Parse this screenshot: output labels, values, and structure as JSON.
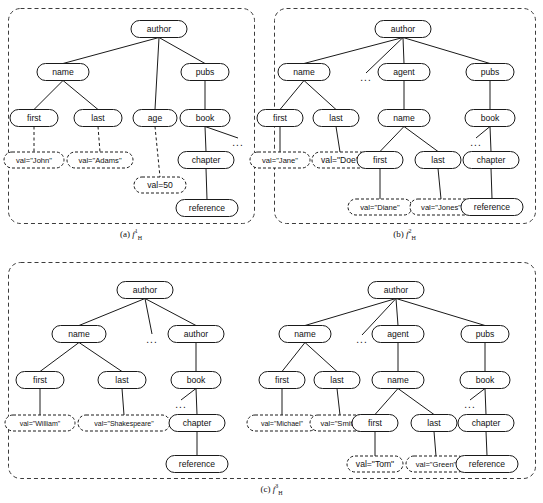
{
  "figure": {
    "panels": [
      {
        "id": "a",
        "caption_prefix": "(a)",
        "caption_symbol": "f",
        "caption_sup": "1",
        "caption_sub": "H",
        "box": {
          "x": 8,
          "y": 8,
          "w": 246,
          "h": 215
        },
        "nodes": [
          {
            "name": "author",
            "label": "author",
            "x": 159,
            "y": 29,
            "w": 56,
            "h": 17,
            "style": "solid"
          },
          {
            "name": "name",
            "label": "name",
            "x": 63,
            "y": 72,
            "w": 52,
            "h": 17,
            "style": "solid"
          },
          {
            "name": "pubs",
            "label": "pubs",
            "x": 205,
            "y": 72,
            "w": 48,
            "h": 17,
            "style": "solid"
          },
          {
            "name": "first",
            "label": "first",
            "x": 34,
            "y": 118,
            "w": 48,
            "h": 17,
            "style": "solid"
          },
          {
            "name": "last",
            "label": "last",
            "x": 98,
            "y": 118,
            "w": 48,
            "h": 17,
            "style": "solid"
          },
          {
            "name": "age",
            "label": "age",
            "x": 155,
            "y": 118,
            "w": 44,
            "h": 17,
            "style": "solid"
          },
          {
            "name": "book",
            "label": "book",
            "x": 205,
            "y": 118,
            "w": 50,
            "h": 17,
            "style": "solid"
          },
          {
            "name": "val-john",
            "label": "val=\"John\"",
            "x": 34,
            "y": 160,
            "w": 60,
            "h": 16,
            "style": "dashed"
          },
          {
            "name": "val-adams",
            "label": "val=\"Adams\"",
            "x": 100,
            "y": 160,
            "w": 66,
            "h": 16,
            "style": "dashed"
          },
          {
            "name": "val-50",
            "label": "val=50",
            "x": 160,
            "y": 185,
            "w": 52,
            "h": 16,
            "style": "dashed"
          },
          {
            "name": "chapter",
            "label": "chapter",
            "x": 206,
            "y": 160,
            "w": 56,
            "h": 17,
            "style": "solid"
          },
          {
            "name": "reference",
            "label": "reference",
            "x": 207,
            "y": 208,
            "w": 62,
            "h": 17,
            "style": "solid"
          }
        ],
        "edges": [
          {
            "from": "author",
            "to": "name",
            "style": "solid"
          },
          {
            "from": "author",
            "to": "age",
            "style": "solid"
          },
          {
            "from": "author",
            "to": "pubs",
            "style": "solid"
          },
          {
            "from": "name",
            "to": "first",
            "style": "solid"
          },
          {
            "from": "name",
            "to": "last",
            "style": "solid"
          },
          {
            "from": "pubs",
            "to": "book",
            "style": "solid"
          },
          {
            "from": "first",
            "to": "val-john",
            "style": "dashed"
          },
          {
            "from": "last",
            "to": "val-adams",
            "style": "dashed"
          },
          {
            "from": "age",
            "to": "val-50",
            "style": "dashed"
          },
          {
            "from": "book",
            "to": "chapter",
            "style": "solid"
          },
          {
            "from": "chapter",
            "to": "reference",
            "style": "solid"
          }
        ],
        "ellipses": [
          {
            "name": "book-ellipsis",
            "label": "...",
            "x": 232,
            "y": 143,
            "from": "book",
            "stub": true
          }
        ]
      },
      {
        "id": "b",
        "caption_prefix": "(b)",
        "caption_symbol": "f",
        "caption_sup": "2",
        "caption_sub": "H",
        "box": {
          "x": 274,
          "y": 8,
          "w": 261,
          "h": 215
        },
        "nodes": [
          {
            "name": "author",
            "label": "author",
            "x": 403,
            "y": 29,
            "w": 56,
            "h": 17,
            "style": "solid"
          },
          {
            "name": "name",
            "label": "name",
            "x": 304,
            "y": 72,
            "w": 52,
            "h": 17,
            "style": "solid"
          },
          {
            "name": "agent",
            "label": "agent",
            "x": 404,
            "y": 72,
            "w": 52,
            "h": 17,
            "style": "solid"
          },
          {
            "name": "pubs",
            "label": "pubs",
            "x": 490,
            "y": 72,
            "w": 48,
            "h": 17,
            "style": "solid"
          },
          {
            "name": "first",
            "label": "first",
            "x": 280,
            "y": 118,
            "w": 46,
            "h": 17,
            "style": "solid"
          },
          {
            "name": "last",
            "label": "last",
            "x": 336,
            "y": 118,
            "w": 46,
            "h": 17,
            "style": "solid"
          },
          {
            "name": "name2",
            "label": "name",
            "x": 404,
            "y": 118,
            "w": 52,
            "h": 17,
            "style": "solid"
          },
          {
            "name": "book",
            "label": "book",
            "x": 490,
            "y": 118,
            "w": 50,
            "h": 17,
            "style": "solid"
          },
          {
            "name": "val-jane",
            "label": "val=\"Jane\"",
            "x": 280,
            "y": 160,
            "w": 60,
            "h": 16,
            "style": "dashed"
          },
          {
            "name": "val-doe",
            "label": "val=\"Doe\"",
            "x": 340,
            "y": 160,
            "w": 56,
            "h": 16,
            "style": "dashed"
          },
          {
            "name": "first2",
            "label": "first",
            "x": 380,
            "y": 160,
            "w": 46,
            "h": 17,
            "style": "solid"
          },
          {
            "name": "last2",
            "label": "last",
            "x": 438,
            "y": 160,
            "w": 46,
            "h": 17,
            "style": "solid"
          },
          {
            "name": "chapter",
            "label": "chapter",
            "x": 491,
            "y": 160,
            "w": 56,
            "h": 17,
            "style": "solid"
          },
          {
            "name": "val-diane",
            "label": "val=\"Diane\"",
            "x": 380,
            "y": 207,
            "w": 64,
            "h": 16,
            "style": "dashed"
          },
          {
            "name": "val-jones",
            "label": "val=\"Jones\"",
            "x": 441,
            "y": 207,
            "w": 62,
            "h": 16,
            "style": "dashed"
          },
          {
            "name": "reference",
            "label": "reference",
            "x": 492,
            "y": 207,
            "w": 62,
            "h": 17,
            "style": "solid"
          }
        ],
        "edges": [
          {
            "from": "author",
            "to": "name",
            "style": "solid"
          },
          {
            "from": "author",
            "to": "agent",
            "style": "solid"
          },
          {
            "from": "author",
            "to": "pubs",
            "style": "solid"
          },
          {
            "from": "name",
            "to": "first",
            "style": "solid"
          },
          {
            "from": "name",
            "to": "last",
            "style": "solid"
          },
          {
            "from": "agent",
            "to": "name2",
            "style": "solid"
          },
          {
            "from": "pubs",
            "to": "book",
            "style": "solid"
          },
          {
            "from": "first",
            "to": "val-jane",
            "style": "solid"
          },
          {
            "from": "last",
            "to": "val-doe",
            "style": "solid"
          },
          {
            "from": "name2",
            "to": "first2",
            "style": "solid"
          },
          {
            "from": "name2",
            "to": "last2",
            "style": "solid"
          },
          {
            "from": "book",
            "to": "chapter",
            "style": "solid"
          },
          {
            "from": "first2",
            "to": "val-diane",
            "style": "solid"
          },
          {
            "from": "last2",
            "to": "val-jones",
            "style": "solid"
          },
          {
            "from": "chapter",
            "to": "reference",
            "style": "solid"
          }
        ],
        "ellipses": [
          {
            "name": "author-ellipsis",
            "label": "...",
            "x": 360,
            "y": 78,
            "from": "author",
            "stub": true
          },
          {
            "name": "book-ellipsis",
            "label": "...",
            "x": 470,
            "y": 143,
            "from": "book",
            "stub": true
          }
        ]
      },
      {
        "id": "c",
        "caption_prefix": "(c)",
        "caption_symbol": "f",
        "caption_sup": "3",
        "caption_sub": "H",
        "box": {
          "x": 8,
          "y": 262,
          "w": 527,
          "h": 216
        },
        "nodes": [
          {
            "name": "author-l",
            "label": "author",
            "x": 145,
            "y": 290,
            "w": 56,
            "h": 17,
            "style": "solid"
          },
          {
            "name": "name-l",
            "label": "name",
            "x": 79,
            "y": 334,
            "w": 54,
            "h": 17,
            "style": "solid"
          },
          {
            "name": "author-l2",
            "label": "author",
            "x": 196,
            "y": 334,
            "w": 56,
            "h": 17,
            "style": "solid"
          },
          {
            "name": "first-l",
            "label": "first",
            "x": 40,
            "y": 380,
            "w": 48,
            "h": 17,
            "style": "solid"
          },
          {
            "name": "last-l",
            "label": "last",
            "x": 122,
            "y": 380,
            "w": 48,
            "h": 17,
            "style": "solid"
          },
          {
            "name": "book-l",
            "label": "book",
            "x": 196,
            "y": 380,
            "w": 50,
            "h": 17,
            "style": "solid"
          },
          {
            "name": "val-william",
            "label": "val=\"William\"",
            "x": 40,
            "y": 423,
            "w": 70,
            "h": 16,
            "style": "dashed"
          },
          {
            "name": "val-shakespeare",
            "label": "val=\"Shakespeare\"",
            "x": 124,
            "y": 423,
            "w": 92,
            "h": 16,
            "style": "dashed"
          },
          {
            "name": "chapter-l",
            "label": "chapter",
            "x": 197,
            "y": 423,
            "w": 56,
            "h": 17,
            "style": "solid"
          },
          {
            "name": "reference-l",
            "label": "reference",
            "x": 197,
            "y": 464,
            "w": 62,
            "h": 17,
            "style": "solid"
          },
          {
            "name": "author-r",
            "label": "author",
            "x": 396,
            "y": 290,
            "w": 56,
            "h": 17,
            "style": "solid"
          },
          {
            "name": "name-r",
            "label": "name",
            "x": 305,
            "y": 334,
            "w": 52,
            "h": 17,
            "style": "solid"
          },
          {
            "name": "agent-r",
            "label": "agent",
            "x": 398,
            "y": 334,
            "w": 52,
            "h": 17,
            "style": "solid"
          },
          {
            "name": "pubs-r",
            "label": "pubs",
            "x": 485,
            "y": 334,
            "w": 48,
            "h": 17,
            "style": "solid"
          },
          {
            "name": "first-r",
            "label": "first",
            "x": 282,
            "y": 380,
            "w": 46,
            "h": 17,
            "style": "solid"
          },
          {
            "name": "last-r",
            "label": "last",
            "x": 337,
            "y": 380,
            "w": 46,
            "h": 17,
            "style": "solid"
          },
          {
            "name": "name-r2",
            "label": "name",
            "x": 398,
            "y": 380,
            "w": 52,
            "h": 17,
            "style": "solid"
          },
          {
            "name": "book-r",
            "label": "book",
            "x": 485,
            "y": 380,
            "w": 50,
            "h": 17,
            "style": "solid"
          },
          {
            "name": "val-michael",
            "label": "val=\"Michael\"",
            "x": 282,
            "y": 423,
            "w": 70,
            "h": 16,
            "style": "dashed"
          },
          {
            "name": "val-smith",
            "label": "val=\"Smith\"",
            "x": 340,
            "y": 423,
            "w": 60,
            "h": 16,
            "style": "dashed"
          },
          {
            "name": "first-r2",
            "label": "first",
            "x": 375,
            "y": 423,
            "w": 46,
            "h": 17,
            "style": "solid"
          },
          {
            "name": "last-r2",
            "label": "last",
            "x": 434,
            "y": 423,
            "w": 46,
            "h": 17,
            "style": "solid"
          },
          {
            "name": "chapter-r",
            "label": "chapter",
            "x": 486,
            "y": 423,
            "w": 56,
            "h": 17,
            "style": "solid"
          },
          {
            "name": "val-tom",
            "label": "val=\"Tom\"",
            "x": 375,
            "y": 464,
            "w": 56,
            "h": 16,
            "style": "dashed"
          },
          {
            "name": "val-green",
            "label": "val=\"Green\"",
            "x": 436,
            "y": 464,
            "w": 60,
            "h": 16,
            "style": "dashed"
          },
          {
            "name": "reference-r",
            "label": "reference",
            "x": 487,
            "y": 464,
            "w": 62,
            "h": 17,
            "style": "solid"
          }
        ],
        "edges": [
          {
            "from": "author-l",
            "to": "name-l",
            "style": "solid"
          },
          {
            "from": "author-l",
            "to": "author-l2",
            "style": "solid"
          },
          {
            "from": "name-l",
            "to": "first-l",
            "style": "solid"
          },
          {
            "from": "name-l",
            "to": "last-l",
            "style": "solid"
          },
          {
            "from": "author-l2",
            "to": "book-l",
            "style": "solid"
          },
          {
            "from": "first-l",
            "to": "val-william",
            "style": "solid"
          },
          {
            "from": "last-l",
            "to": "val-shakespeare",
            "style": "solid"
          },
          {
            "from": "book-l",
            "to": "chapter-l",
            "style": "solid"
          },
          {
            "from": "chapter-l",
            "to": "reference-l",
            "style": "solid"
          },
          {
            "from": "author-r",
            "to": "name-r",
            "style": "solid"
          },
          {
            "from": "author-r",
            "to": "agent-r",
            "style": "solid"
          },
          {
            "from": "author-r",
            "to": "pubs-r",
            "style": "solid"
          },
          {
            "from": "name-r",
            "to": "first-r",
            "style": "solid"
          },
          {
            "from": "name-r",
            "to": "last-r",
            "style": "solid"
          },
          {
            "from": "agent-r",
            "to": "name-r2",
            "style": "solid"
          },
          {
            "from": "pubs-r",
            "to": "book-r",
            "style": "solid"
          },
          {
            "from": "first-r",
            "to": "val-michael",
            "style": "solid"
          },
          {
            "from": "last-r",
            "to": "val-smith",
            "style": "solid"
          },
          {
            "from": "name-r2",
            "to": "first-r2",
            "style": "solid"
          },
          {
            "from": "name-r2",
            "to": "last-r2",
            "style": "solid"
          },
          {
            "from": "book-r",
            "to": "chapter-r",
            "style": "solid"
          },
          {
            "from": "first-r2",
            "to": "val-tom",
            "style": "solid"
          },
          {
            "from": "last-r2",
            "to": "val-green",
            "style": "solid"
          },
          {
            "from": "chapter-r",
            "to": "reference-r",
            "style": "solid"
          }
        ],
        "ellipses": [
          {
            "name": "author-l-ellipsis",
            "label": "...",
            "x": 146,
            "y": 340,
            "from": "author-l",
            "stub": false
          },
          {
            "name": "book-l-ellipsis",
            "label": "...",
            "x": 175,
            "y": 405,
            "from": "book-l",
            "stub": true
          },
          {
            "name": "author-r-ellipsis",
            "label": "...",
            "x": 356,
            "y": 340,
            "from": "author-r",
            "stub": true
          },
          {
            "name": "book-r-ellipsis",
            "label": "...",
            "x": 464,
            "y": 405,
            "from": "book-r",
            "stub": true
          }
        ]
      }
    ],
    "colors": {
      "node_stroke": "#1a1a1a",
      "node_fill": "#ffffff",
      "edge": "#1a1a1a",
      "panel_border": "#3c3c3c",
      "text": "#111111",
      "background": "#ffffff"
    }
  }
}
